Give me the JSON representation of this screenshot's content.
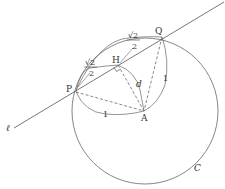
{
  "diagram": {
    "type": "geometry",
    "line_label": "ℓ",
    "circle_label": "C",
    "points": {
      "P": {
        "label": "P",
        "x": 76,
        "y": 92
      },
      "H": {
        "label": "H",
        "x": 118,
        "y": 65
      },
      "Q": {
        "label": "Q",
        "x": 162,
        "y": 37
      },
      "A": {
        "label": "A",
        "x": 144,
        "y": 111
      }
    },
    "measures": {
      "PH": {
        "num": "√2",
        "den": "2"
      },
      "HQ": {
        "num": "√2",
        "den": "2"
      },
      "PA": "1",
      "QA": "1",
      "AH": "d"
    },
    "colors": {
      "stroke": "#555555",
      "text": "#333333"
    }
  }
}
